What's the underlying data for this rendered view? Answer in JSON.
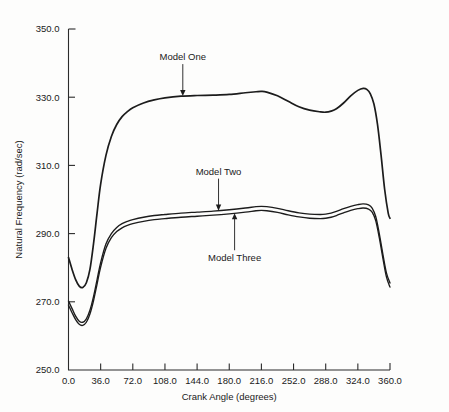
{
  "chart_data": {
    "type": "line",
    "title": "",
    "xlabel": "Crank Angle (degrees)",
    "ylabel": "Natural Frequency (rad/sec)",
    "xlim": [
      0.0,
      360.0
    ],
    "ylim": [
      250.0,
      350.0
    ],
    "xticks": [
      "0.0",
      "36.0",
      "72.0",
      "108.0",
      "144.0",
      "180.0",
      "216.0",
      "252.0",
      "288.0",
      "324.0",
      "360.0"
    ],
    "yticks": [
      "250.0",
      "270.0",
      "290.0",
      "310.0",
      "330.0",
      "350.0"
    ],
    "xtick_values": [
      0,
      36,
      72,
      108,
      144,
      180,
      216,
      252,
      288,
      324,
      360
    ],
    "ytick_values": [
      250,
      270,
      290,
      310,
      330,
      350
    ],
    "grid": false,
    "legend": "none",
    "annotations": [
      {
        "text": "Model One",
        "series": "Model One",
        "x": 128,
        "y": 329,
        "arrow": "down"
      },
      {
        "text": "Model Two",
        "series": "Model Two",
        "x": 168,
        "y": 297,
        "arrow": "down"
      },
      {
        "text": "Model Three",
        "series": "Model Three",
        "x": 186,
        "y": 295,
        "arrow": "up"
      }
    ],
    "series": [
      {
        "name": "Model One",
        "color": "#1c1c1c",
        "x": [
          0,
          4,
          8,
          12,
          16,
          20,
          24,
          28,
          32,
          36,
          42,
          48,
          54,
          60,
          66,
          72,
          84,
          96,
          108,
          126,
          144,
          162,
          180,
          198,
          210,
          216,
          222,
          234,
          246,
          258,
          270,
          282,
          288,
          294,
          300,
          308,
          316,
          324,
          330,
          334,
          338,
          342,
          346,
          350,
          354,
          358,
          360
        ],
        "y": [
          283.0,
          279.5,
          276.5,
          274.6,
          274.2,
          275.6,
          279.5,
          287.0,
          296.0,
          304.5,
          313.0,
          318.5,
          322.0,
          324.3,
          325.8,
          326.9,
          328.3,
          329.2,
          329.8,
          330.3,
          330.5,
          330.6,
          330.8,
          331.3,
          331.6,
          331.7,
          331.5,
          330.4,
          328.8,
          327.2,
          326.2,
          325.7,
          325.6,
          325.9,
          326.6,
          328.3,
          330.4,
          332.0,
          332.6,
          332.3,
          331.0,
          328.0,
          322.0,
          313.0,
          303.0,
          296.0,
          294.5
        ]
      },
      {
        "name": "Model Two",
        "color": "#1c1c1c",
        "x": [
          0,
          4,
          8,
          12,
          16,
          20,
          24,
          28,
          32,
          36,
          42,
          48,
          54,
          60,
          66,
          72,
          84,
          96,
          108,
          126,
          144,
          162,
          180,
          198,
          210,
          216,
          222,
          234,
          246,
          258,
          270,
          282,
          288,
          294,
          300,
          308,
          316,
          324,
          330,
          336,
          340,
          344,
          348,
          352,
          356,
          360
        ],
        "y": [
          270.2,
          268.0,
          265.8,
          264.3,
          264.0,
          265.0,
          267.5,
          271.5,
          276.5,
          281.5,
          287.0,
          290.0,
          291.8,
          292.9,
          293.6,
          294.1,
          294.8,
          295.3,
          295.6,
          296.0,
          296.3,
          296.6,
          297.0,
          297.5,
          297.9,
          298.0,
          297.9,
          297.4,
          296.7,
          296.1,
          295.7,
          295.6,
          295.7,
          296.0,
          296.5,
          297.3,
          298.0,
          298.5,
          298.7,
          298.4,
          297.5,
          295.0,
          290.0,
          284.0,
          278.5,
          275.5
        ]
      },
      {
        "name": "Model Three",
        "color": "#1c1c1c",
        "x": [
          0,
          4,
          8,
          12,
          16,
          20,
          24,
          28,
          32,
          36,
          42,
          48,
          54,
          60,
          66,
          72,
          84,
          96,
          108,
          126,
          144,
          162,
          180,
          198,
          210,
          216,
          222,
          234,
          246,
          258,
          270,
          282,
          288,
          294,
          300,
          308,
          316,
          324,
          330,
          336,
          340,
          344,
          348,
          352,
          356,
          360
        ],
        "y": [
          269.0,
          266.8,
          264.8,
          263.4,
          263.1,
          264.0,
          266.4,
          270.3,
          275.2,
          280.2,
          285.7,
          288.8,
          290.6,
          291.7,
          292.4,
          292.9,
          293.6,
          294.1,
          294.4,
          294.8,
          295.1,
          295.4,
          295.8,
          296.3,
          296.7,
          296.8,
          296.7,
          296.2,
          295.5,
          294.9,
          294.5,
          294.4,
          294.5,
          294.8,
          295.3,
          296.1,
          296.8,
          297.3,
          297.5,
          297.2,
          296.3,
          293.8,
          288.8,
          282.8,
          277.3,
          274.3
        ]
      }
    ]
  }
}
